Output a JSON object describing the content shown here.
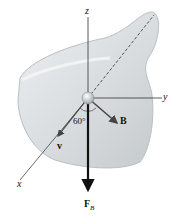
{
  "figure": {
    "axes": {
      "z": "z",
      "y": "y",
      "x": "x"
    },
    "vectors": {
      "velocity": "v",
      "field": "B",
      "force": "F",
      "force_sub": "B"
    },
    "angle_label": "60°"
  }
}
